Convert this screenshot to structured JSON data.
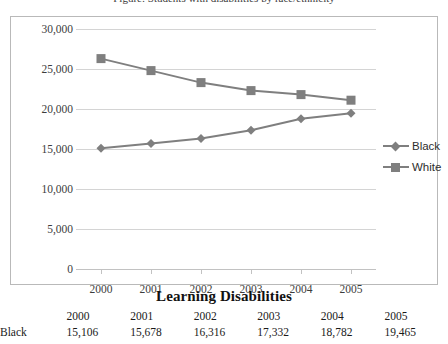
{
  "caption_sliver": "Figure: Students with disabilities by race/ethnicity",
  "legend": {
    "position": "right",
    "entries": [
      {
        "label": "Black",
        "marker": "diamond",
        "color": "#7f7f7f"
      },
      {
        "label": "White",
        "marker": "square",
        "color": "#7f7f7f"
      }
    ]
  },
  "table": {
    "title": "Learning Disabilities",
    "columns": [
      "",
      "2000",
      "2001",
      "2002",
      "2003",
      "2004",
      "2005"
    ],
    "rows": [
      {
        "label": "Black",
        "values": [
          "15,106",
          "15,678",
          "16,316",
          "17,332",
          "18,782",
          "19,465"
        ]
      }
    ]
  },
  "chart_data": {
    "type": "line",
    "title": "",
    "subtitle": "",
    "xlabel": "",
    "ylabel": "",
    "categories": [
      "2000",
      "2001",
      "2002",
      "2003",
      "2004",
      "2005"
    ],
    "series": [
      {
        "name": "Black",
        "marker": "diamond",
        "color": "#7f7f7f",
        "values": [
          15106,
          15678,
          16316,
          17332,
          18782,
          19465
        ]
      },
      {
        "name": "White",
        "marker": "square",
        "color": "#7f7f7f",
        "values": [
          26300,
          24800,
          23300,
          22300,
          21800,
          21100
        ]
      }
    ],
    "ylim": [
      0,
      30000
    ],
    "ytick_values": [
      0,
      5000,
      10000,
      15000,
      20000,
      25000,
      30000
    ],
    "ytick_labels": [
      "0",
      "5,000",
      "10,000",
      "15,000",
      "20,000",
      "25,000",
      "30,000"
    ],
    "xtick_labels": [
      "2000",
      "2001",
      "2002",
      "2003",
      "2004",
      "2005"
    ],
    "grid": true,
    "grid_axis": "y",
    "legend_position": "right"
  }
}
